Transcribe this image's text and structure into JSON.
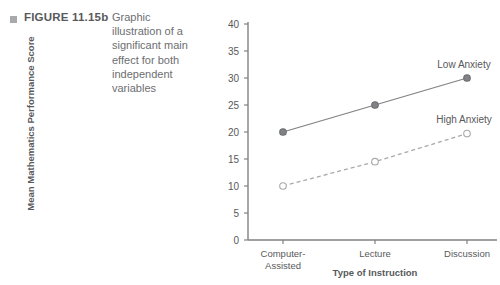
{
  "figure": {
    "bullet": "square-bullet",
    "label": "FIGURE 11.15b",
    "caption": "Graphic illustration of a significant main effect for both independent variables"
  },
  "colors": {
    "text": "#58595b",
    "caption_text": "#6d6e71",
    "axis": "#808285",
    "series_low": "#808285",
    "series_high": "#a7a9ac",
    "bullet": "#a7a9ac"
  },
  "chart_data": {
    "type": "line",
    "title": "",
    "xlabel": "Type of Instruction",
    "ylabel": "Mean Mathematics Performance Score",
    "categories": [
      "Computer-\nAssisted",
      "Lecture",
      "Discussion"
    ],
    "category_labels": [
      "Computer-Assisted",
      "Lecture",
      "Discussion"
    ],
    "ylim": [
      0,
      40
    ],
    "yticks": [
      0,
      5,
      10,
      15,
      20,
      25,
      30,
      35,
      40
    ],
    "grid": false,
    "legend_position": "inline-right",
    "series": [
      {
        "name": "Low Anxiety",
        "values": [
          20,
          25,
          30
        ],
        "marker": "filled-circle",
        "line_style": "solid",
        "color": "#808285"
      },
      {
        "name": "High Anxiety",
        "values": [
          10,
          14.5,
          19.7
        ],
        "marker": "open-circle",
        "line_style": "dashed",
        "color": "#a7a9ac"
      }
    ],
    "annotations": [
      {
        "text": "Low Anxiety",
        "x": 464,
        "y": 64
      },
      {
        "text": "High Anxiety",
        "x": 464,
        "y": 119
      }
    ]
  }
}
